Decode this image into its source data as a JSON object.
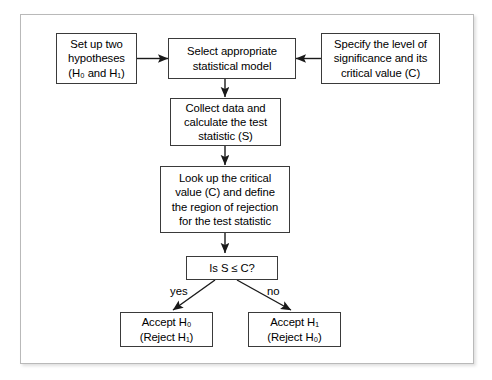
{
  "diagram": {
    "background_color": "#ffffff",
    "frame_border_color": "#b9b9b9",
    "node_border_color": "#3a3a3a",
    "edge_color": "#1a1a1a",
    "nodes": [
      {
        "id": "setup",
        "shape": "rect",
        "lines": [
          "Set up two",
          "hypotheses",
          "(H0 and H1)"
        ],
        "text": "Set up two\nhypotheses\n(H₀ and H₁)"
      },
      {
        "id": "select-model",
        "shape": "rect",
        "lines": [
          "Select appropriate",
          "statistical model"
        ],
        "text": "Select appropriate\nstatistical model"
      },
      {
        "id": "specify-significance",
        "shape": "rect",
        "lines": [
          "Specify the level of",
          "significance and its",
          "critical value (C)"
        ],
        "text": "Specify the level of\nsignificance and its\ncritical value (C)"
      },
      {
        "id": "collect-data",
        "shape": "rect",
        "lines": [
          "Collect data and",
          "calculate the test",
          "statistic (S)"
        ],
        "text": "Collect data and\ncalculate the test\nstatistic (S)"
      },
      {
        "id": "look-up-critical",
        "shape": "rect",
        "lines": [
          "Look up the critical",
          "value (C) and define",
          "the region of rejection",
          "for the test statistic"
        ],
        "text": "Look up the critical\nvalue (C) and define\nthe region of rejection\nfor the test statistic"
      },
      {
        "id": "decision",
        "shape": "rect",
        "lines": [
          "Is S ≤ C?"
        ],
        "text": "Is S ≤ C?"
      },
      {
        "id": "accept-h0",
        "shape": "rect",
        "lines": [
          "Accept H0",
          "(Reject H1)"
        ],
        "text": "Accept H₀\n(Reject H₁)"
      },
      {
        "id": "accept-h1",
        "shape": "rect",
        "lines": [
          "Accept H1",
          "(Reject H0)"
        ],
        "text": "Accept H₁\n(Reject H₀)"
      }
    ],
    "edges": [
      {
        "id": "setup-to-select",
        "from": "setup",
        "to": "select-model",
        "label": ""
      },
      {
        "id": "specify-to-select",
        "from": "specify-significance",
        "to": "select-model",
        "label": ""
      },
      {
        "id": "select-to-collect",
        "from": "select-model",
        "to": "collect-data",
        "label": ""
      },
      {
        "id": "collect-to-lookup",
        "from": "collect-data",
        "to": "look-up-critical",
        "label": ""
      },
      {
        "id": "lookup-to-decision",
        "from": "look-up-critical",
        "to": "decision",
        "label": ""
      },
      {
        "id": "decision-to-accept-h0",
        "from": "decision",
        "to": "accept-h0",
        "label": "yes"
      },
      {
        "id": "decision-to-accept-h1",
        "from": "decision",
        "to": "accept-h1",
        "label": "no"
      }
    ],
    "labels": {
      "yes": "yes",
      "no": "no"
    }
  }
}
